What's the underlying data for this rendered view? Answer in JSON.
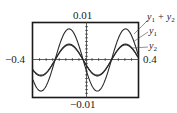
{
  "chart_data": {
    "type": "line",
    "title": "",
    "xlabel": "",
    "ylabel": "",
    "window": {
      "xmin": -0.4,
      "xmax": 0.4,
      "ymin": -0.01,
      "ymax": 0.01
    },
    "tick_labels": {
      "ymax": "0.01",
      "ymin": "−0.01",
      "xmin": "−0.4",
      "xmax": "0.4"
    },
    "grid": false,
    "axes_crossing": {
      "x": 0,
      "y": 0
    },
    "series": [
      {
        "name": "y1",
        "label": "y1",
        "amplitude": 0.0043,
        "period": 0.43,
        "phase_peak_x": -0.125,
        "description": "sinusoid, nearly identical to y2"
      },
      {
        "name": "y2",
        "label": "y2",
        "amplitude": 0.0041,
        "period": 0.43,
        "phase_peak_x": -0.125,
        "description": "sinusoid, nearly identical to y1"
      },
      {
        "name": "y1 + y2",
        "label": "y1 + y2",
        "amplitude": 0.0084,
        "period": 0.43,
        "phase_peak_x": -0.125,
        "description": "sum; about double amplitude"
      }
    ],
    "legend": {
      "position": "right, outside frame, with leader lines",
      "entries": [
        "y1 + y2",
        "y1",
        "y2"
      ]
    }
  },
  "labels": {
    "top": "0.01",
    "bottom": "−0.01",
    "left": "−0.4",
    "right": "0.4",
    "sum_base": "y",
    "sum_sub1": "1",
    "sum_plus": " + y",
    "sum_sub2": "2",
    "y1_base": "y",
    "y1_sub": "1",
    "y2_base": "y",
    "y2_sub": "2"
  },
  "colors": {
    "frame": "#1a1a1a",
    "curves": "#2a2a2a",
    "background": "#ffffff"
  }
}
